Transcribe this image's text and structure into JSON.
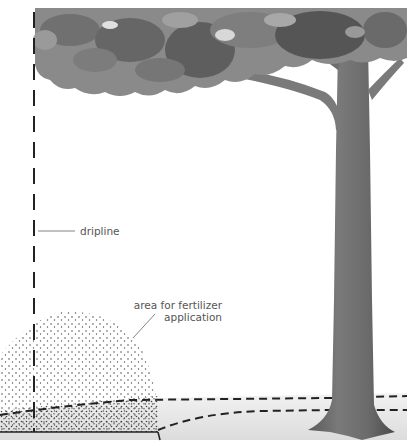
{
  "diagram": {
    "labels": {
      "dripline": "dripline",
      "area_line1": "area for fertilizer",
      "area_line2": "application"
    },
    "colors": {
      "background": "#ffffff",
      "canopy_dark": "#5a5a5a",
      "canopy_mid": "#808080",
      "canopy_light": "#a8a8a8",
      "trunk": "#6e6e6e",
      "trunk_dark": "#4e4e4e",
      "ground": "#e6e6e6",
      "dashes": "#222222",
      "label_text": "#555555",
      "leader_line": "#666666",
      "dots": "#333333"
    }
  }
}
